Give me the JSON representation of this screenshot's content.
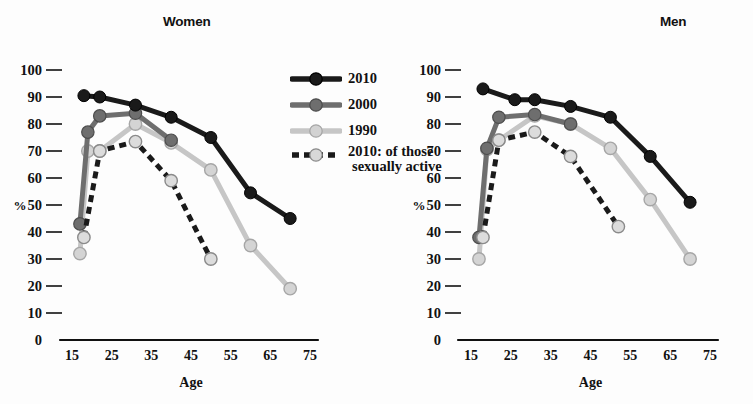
{
  "charts": {
    "women": {
      "title": "Women"
    },
    "men": {
      "title": "Men"
    }
  },
  "axes": {
    "ylabel": "%",
    "xlabel": "Age",
    "yticks": [
      "100",
      "90",
      "80",
      "70",
      "60",
      "50",
      "40",
      "30",
      "20",
      "10",
      "0"
    ],
    "xticks": [
      "15",
      "25",
      "35",
      "45",
      "55",
      "65",
      "75"
    ]
  },
  "legend": {
    "items": [
      {
        "label": "2010",
        "label2": "",
        "color": "#1a1a1a",
        "dashed": false,
        "marker_fill": "#1a1a1a"
      },
      {
        "label": "2000",
        "label2": "",
        "color": "#6e6e6e",
        "dashed": false,
        "marker_fill": "#6e6e6e"
      },
      {
        "label": "1990",
        "label2": "",
        "color": "#c6c6c6",
        "dashed": false,
        "marker_fill": "#d2d2d2"
      },
      {
        "label": "2010: of those",
        "label2": "sexually active",
        "color": "#1a1a1a",
        "dashed": true,
        "marker_fill": "#d8d8d8"
      }
    ]
  },
  "colors": {
    "series_2010": "#1a1a1a",
    "series_2000": "#6e6e6e",
    "series_1990": "#c6c6c6",
    "series_2010_active": "#1a1a1a",
    "axis": "#111111",
    "background": "#fdfdfd"
  },
  "chart_data": [
    {
      "type": "line",
      "title": "Women",
      "xlabel": "Age",
      "ylabel": "%",
      "xlim": [
        13,
        77
      ],
      "ylim": [
        0,
        100
      ],
      "xticks": [
        15,
        25,
        35,
        45,
        55,
        65,
        75
      ],
      "yticks": [
        0,
        10,
        20,
        30,
        40,
        50,
        60,
        70,
        80,
        90,
        100
      ],
      "grid": false,
      "legend_position": "center-top-between-panels",
      "series": [
        {
          "name": "2010",
          "color": "#1a1a1a",
          "dashed": false,
          "x": [
            18,
            22,
            31,
            40,
            50,
            60,
            70
          ],
          "values": [
            90.5,
            90,
            87,
            82.5,
            75,
            54.5,
            45
          ]
        },
        {
          "name": "2000",
          "color": "#6e6e6e",
          "dashed": false,
          "x": [
            17,
            19,
            22,
            31,
            40
          ],
          "values": [
            43,
            77,
            83,
            84,
            74
          ]
        },
        {
          "name": "1990",
          "color": "#c6c6c6",
          "dashed": false,
          "x": [
            17,
            19,
            22,
            31,
            40,
            50,
            60,
            70
          ],
          "values": [
            32,
            70,
            70,
            80,
            73,
            63,
            35,
            19
          ]
        },
        {
          "name": "2010: of those sexually active",
          "color": "#1a1a1a",
          "dashed": true,
          "x": [
            18,
            22,
            31,
            40,
            50
          ],
          "values": [
            38,
            70,
            73.5,
            59,
            30
          ]
        }
      ]
    },
    {
      "type": "line",
      "title": "Men",
      "xlabel": "Age",
      "ylabel": "%",
      "xlim": [
        13,
        77
      ],
      "ylim": [
        0,
        100
      ],
      "xticks": [
        15,
        25,
        35,
        45,
        55,
        65,
        75
      ],
      "yticks": [
        0,
        10,
        20,
        30,
        40,
        50,
        60,
        70,
        80,
        90,
        100
      ],
      "grid": false,
      "legend_position": "shared",
      "series": [
        {
          "name": "2010",
          "color": "#1a1a1a",
          "dashed": false,
          "x": [
            18,
            26,
            31,
            40,
            50,
            60,
            70
          ],
          "values": [
            93,
            89,
            89,
            86.5,
            82.5,
            68,
            51
          ]
        },
        {
          "name": "2000",
          "color": "#6e6e6e",
          "dashed": false,
          "x": [
            17,
            19,
            22,
            31,
            40
          ],
          "values": [
            38,
            71,
            82.5,
            83.5,
            80
          ]
        },
        {
          "name": "1990",
          "color": "#c6c6c6",
          "dashed": false,
          "x": [
            17,
            19,
            22,
            31,
            40,
            50,
            60,
            70
          ],
          "values": [
            30,
            70.5,
            74,
            83,
            80,
            71,
            52,
            30
          ]
        },
        {
          "name": "2010: of those sexually active",
          "color": "#1a1a1a",
          "dashed": true,
          "x": [
            18,
            22,
            31,
            40,
            52
          ],
          "values": [
            38,
            74,
            77,
            68,
            42
          ]
        }
      ]
    }
  ]
}
